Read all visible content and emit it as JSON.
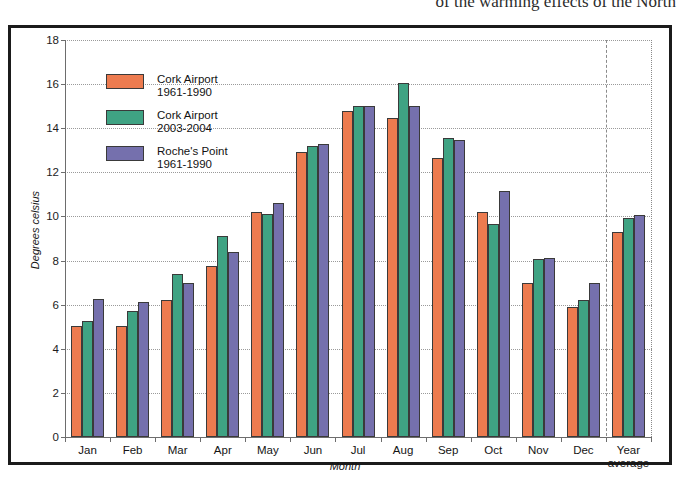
{
  "page": {
    "top_text": "of the warming effects of the North"
  },
  "figure": {
    "frame_color": "#1b1b1b",
    "background": "#ffffff"
  },
  "legend": {
    "position": "inside-top-left",
    "entries": [
      {
        "name_line1": "Cork Airport",
        "name_line2": "1961-1990",
        "color": "#ED7B4F"
      },
      {
        "name_line1": "Cork Airport",
        "name_line2": "2003-2004",
        "color": "#3FA383"
      },
      {
        "name_line1": "Roche's Point",
        "name_line2": "1961-1990",
        "color": "#7570AD"
      }
    ]
  },
  "chart_data": {
    "type": "bar",
    "title": "",
    "xlabel": "Month",
    "ylabel": "Degrees celsius",
    "ylim": [
      0,
      18
    ],
    "yticks": [
      0,
      2,
      4,
      6,
      8,
      10,
      12,
      14,
      16,
      18
    ],
    "grid": true,
    "categories": [
      "Jan",
      "Feb",
      "Mar",
      "Apr",
      "May",
      "Jun",
      "Jul",
      "Aug",
      "Sep",
      "Oct",
      "Nov",
      "Dec",
      "Year average"
    ],
    "category_labels_multiline": {
      "Year average": [
        "Year",
        "average"
      ]
    },
    "series": [
      {
        "name": "Cork Airport 1961-1990",
        "color": "#ED7B4F",
        "values": [
          5.05,
          5.05,
          6.2,
          7.75,
          10.2,
          12.9,
          14.8,
          14.45,
          12.65,
          10.2,
          7.0,
          5.9,
          9.3
        ]
      },
      {
        "name": "Cork Airport 2003-2004",
        "color": "#3FA383",
        "values": [
          5.25,
          5.7,
          7.4,
          9.1,
          10.1,
          13.2,
          15.0,
          16.05,
          13.55,
          9.65,
          8.05,
          6.2,
          9.95
        ]
      },
      {
        "name": "Roche's Point 1961-1990",
        "color": "#7570AD",
        "values": [
          6.25,
          6.1,
          7.0,
          8.4,
          10.6,
          13.3,
          15.0,
          15.0,
          13.45,
          11.15,
          8.1,
          7.0,
          10.05
        ]
      }
    ],
    "separator_before_category": "Year average"
  }
}
